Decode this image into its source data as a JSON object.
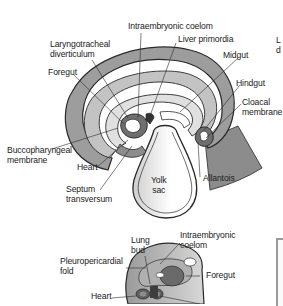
{
  "figure": {
    "upper_diagram": {
      "labels": {
        "intraembryonic_coelom": "Intraembryonic coelom",
        "liver_primordia": "Liver primordia",
        "laryngotracheal_1": "Laryngotracheal",
        "laryngotracheal_2": "diverticulum",
        "foregut": "Foregut",
        "midgut": "Midgut",
        "hindgut": "Hindgut",
        "cloacal_1": "Cloacal",
        "cloacal_2": "membrane",
        "buccopharyngeal_1": "Buccopharyngeal",
        "buccopharyngeal_2": "membrane",
        "heart": "Heart",
        "septum_1": "Septum",
        "septum_2": "transversum",
        "yolk_1": "Yolk",
        "yolk_2": "sac",
        "allantois": "Allantois"
      }
    },
    "lower_diagram": {
      "labels": {
        "lung_1": "Lung",
        "lung_2": "bud",
        "coelom_1": "Intraembryonic",
        "coelom_2": "coelom",
        "pleuro_1": "Pleuropericardial",
        "pleuro_2": "fold",
        "foregut": "Foregut",
        "heart": "Heart"
      }
    },
    "side_text": {
      "line1": "L",
      "line2": "d"
    },
    "colors": {
      "outline": "#2a2a2a",
      "dark_gray": "#8c8c8c",
      "mid_gray": "#b5b5b5",
      "light_gray": "#d9d9d9",
      "background": "#ffffff"
    }
  }
}
